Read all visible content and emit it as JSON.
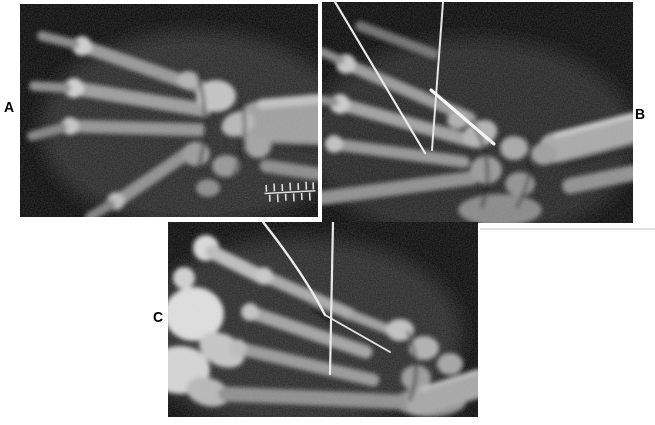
{
  "figure": {
    "type": "composite-radiograph-figure",
    "background_color": "#ffffff",
    "film_color": "#0a0a0a",
    "bone_color": "#a8a8a8",
    "wire_color": "#f0f0f0",
    "label_color": "#000000",
    "panels": [
      {
        "label": "A",
        "content": "oblique radiograph of hand and wrist, fingers to the left, forearm entering from the right, small radiopaque ruler marker at lower right",
        "wires": 0,
        "has_ruler_marker": true
      },
      {
        "label": "B",
        "content": "radiograph of hand and wrist with two long thin fixation wires entering from the top and a short bright pin at the carpus",
        "wires": 3,
        "has_ruler_marker": false
      },
      {
        "label": "C",
        "content": "oblique radiograph of hand and wrist with one curved wire bending toward the carpus and one straight vertical wire",
        "wires": 2,
        "has_ruler_marker": false
      }
    ]
  }
}
